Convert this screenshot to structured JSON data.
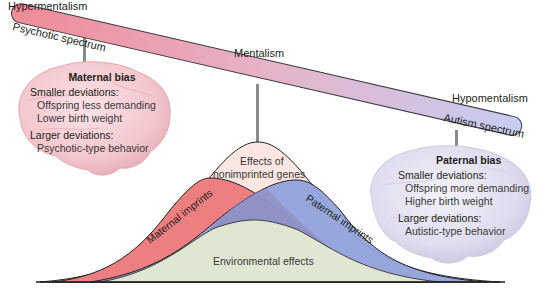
{
  "labels": {
    "hyper": "Hypermentalism",
    "center": "Mentalism",
    "hypo": "Hypomentalism"
  },
  "bar": {
    "left_label": "Psychotic spectrum",
    "right_label": "Autism spectrum",
    "left_color": "#f08a96",
    "right_color": "#c6cdf3"
  },
  "maternal_brain": {
    "title": "Maternal bias",
    "smaller_heading": "Smaller deviations:",
    "smaller_items": [
      "Offspring less demanding",
      "Lower birth weight"
    ],
    "larger_heading": "Larger deviations:",
    "larger_items": [
      "Psychotic-type behavior"
    ],
    "color": "#f4c8cf"
  },
  "paternal_brain": {
    "title": "Paternal bias",
    "smaller_heading": "Smaller deviations:",
    "smaller_items": [
      "Offspring more demanding",
      "Higher birth weight"
    ],
    "larger_heading": "Larger deviations:",
    "larger_items": [
      "Autistic-type behavior"
    ],
    "color": "#dcdcf0"
  },
  "curves": {
    "nonimprinted_label_1": "Effects of",
    "nonimprinted_label_2": "nonimprinted genes",
    "maternal_label": "Maternal imprints",
    "paternal_label": "Paternal imprints",
    "environmental_label": "Environmental effects",
    "colors": {
      "nonimprinted": "#fbe6e2",
      "maternal": "#ee7f80",
      "paternal": "#8ea2dc",
      "overlap": "#8d86b8",
      "environmental": "#dfe6d2"
    }
  }
}
